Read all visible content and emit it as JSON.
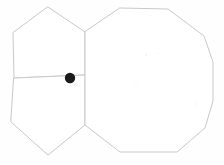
{
  "figure": {
    "background_color": "#fefefe",
    "stroke_color": "#c9c9c9",
    "stroke_width": 1,
    "marker_color": "#1a1a1a",
    "width": 224,
    "height": 165,
    "shapes": [
      {
        "id": "pentagon-upper-left",
        "name": "upper-left-pentagon",
        "sides": 5,
        "points": "48,7 85,32 85,75 14,78 13,33"
      },
      {
        "id": "pentagon-lower-left",
        "name": "lower-left-pentagon",
        "sides": 5,
        "points": "14,78 85,75 85,125 48,155 11,122"
      },
      {
        "id": "decagon-right",
        "name": "right-decagon",
        "sides": 10,
        "points": "120,8 168,9 204,36 213,62 213,101 205,128 177,152 120,152 85,125 85,32"
      }
    ],
    "markers": [
      {
        "id": "junction-dot",
        "name": "shared-vertex-marker",
        "cx": 70,
        "cy": 78,
        "r": 5.2,
        "color": "#1a1a1a"
      }
    ],
    "specks": [
      {
        "cx": 150,
        "cy": 16,
        "r": 0.8
      },
      {
        "cx": 112,
        "cy": 52,
        "r": 0.7
      },
      {
        "cx": 146,
        "cy": 55,
        "r": 0.9
      },
      {
        "cx": 158,
        "cy": 53,
        "r": 0.7
      },
      {
        "cx": 136,
        "cy": 82,
        "r": 0.8
      },
      {
        "cx": 165,
        "cy": 88,
        "r": 0.7
      },
      {
        "cx": 196,
        "cy": 104,
        "r": 0.8
      },
      {
        "cx": 60,
        "cy": 112,
        "r": 0.7
      },
      {
        "cx": 36,
        "cy": 140,
        "r": 0.7
      },
      {
        "cx": 190,
        "cy": 140,
        "r": 0.8
      }
    ]
  }
}
